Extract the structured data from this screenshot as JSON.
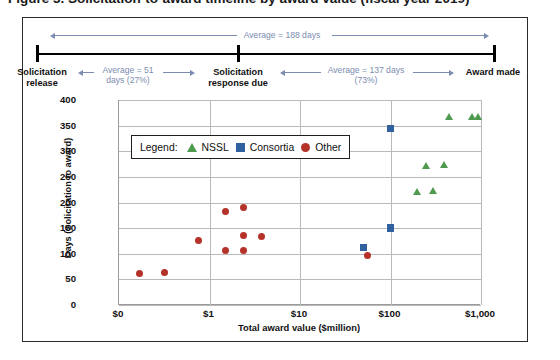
{
  "caption": "Figure 3. Solicitation-to-award timeline by award value (fiscal year 2019)",
  "timeline": {
    "overall_label": "Average = 188 days",
    "nodes": [
      {
        "name": "solicitation-release",
        "line1": "Solicitation",
        "line2": "release"
      },
      {
        "name": "solicitation-response-due",
        "line1": "Solicitation",
        "line2": "response due"
      },
      {
        "name": "award-made",
        "line1": "Award made",
        "line2": ""
      }
    ],
    "segments": [
      {
        "name": "pre-response",
        "line1": "Average = 51",
        "line2": "days (27%)"
      },
      {
        "name": "post-response",
        "line1": "Average = 137 days",
        "line2": "(73%)"
      }
    ]
  },
  "legend": {
    "title": "Legend:",
    "items": [
      {
        "label": "NSSL",
        "marker": "triangle",
        "color": "#4e9a4e"
      },
      {
        "label": "Consortia",
        "marker": "square",
        "color": "#31609e"
      },
      {
        "label": "Other",
        "marker": "circle",
        "color": "#b5322a"
      }
    ]
  },
  "chart_data": {
    "type": "scatter",
    "title": "",
    "xlabel": "Total award value ($million)",
    "ylabel": "Days (Solicitation to award)",
    "xscale": "log",
    "xticks": [
      "$0",
      "$1",
      "$10",
      "$100",
      "$1,000"
    ],
    "xtick_values": [
      0.1,
      1,
      10,
      100,
      1000
    ],
    "yticks": [
      0,
      50,
      100,
      150,
      200,
      250,
      300,
      350,
      400
    ],
    "ylim": [
      0,
      400
    ],
    "grid": "horizontal-and-vertical",
    "legend_position": "inside-upper-left",
    "series": [
      {
        "name": "NSSL",
        "marker": "triangle",
        "color": "#4e9a4e",
        "points": [
          {
            "x": 200,
            "y": 220
          },
          {
            "x": 300,
            "y": 222
          },
          {
            "x": 250,
            "y": 270
          },
          {
            "x": 400,
            "y": 272
          },
          {
            "x": 450,
            "y": 366
          },
          {
            "x": 800,
            "y": 366
          },
          {
            "x": 950,
            "y": 366
          }
        ]
      },
      {
        "name": "Consortia",
        "marker": "square",
        "color": "#31609e",
        "points": [
          {
            "x": 50,
            "y": 112
          },
          {
            "x": 100,
            "y": 150
          },
          {
            "x": 100,
            "y": 344
          }
        ]
      },
      {
        "name": "Other",
        "marker": "circle",
        "color": "#b5322a",
        "points": [
          {
            "x": 0.17,
            "y": 61
          },
          {
            "x": 0.32,
            "y": 63
          },
          {
            "x": 0.75,
            "y": 125
          },
          {
            "x": 1.5,
            "y": 182
          },
          {
            "x": 2.4,
            "y": 191
          },
          {
            "x": 2.4,
            "y": 135
          },
          {
            "x": 3.8,
            "y": 133
          },
          {
            "x": 1.5,
            "y": 107
          },
          {
            "x": 2.4,
            "y": 106
          },
          {
            "x": 55,
            "y": 96
          }
        ]
      }
    ]
  }
}
